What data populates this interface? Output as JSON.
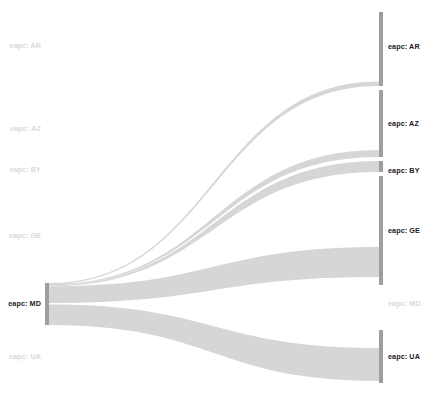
{
  "figure": {
    "type": "sankey",
    "width": 427,
    "height": 401,
    "background": "#ffffff",
    "node_color_active": "#9e9e9e",
    "node_color_inactive": "#e8e8e8",
    "link_color": "#d6d6d6",
    "label_color_active": "#1a1a1a",
    "label_color_inactive": "#d9d9d9"
  },
  "nodes": {
    "left": [
      {
        "id": "L-AR",
        "label": "eapc: AR",
        "x": 45,
        "y0": 32,
        "y1": 32,
        "value": 0,
        "active": false,
        "label_x": 41,
        "label_y": 46
      },
      {
        "id": "L-AZ",
        "label": "eapc: AZ",
        "x": 45,
        "y0": 129,
        "y1": 129,
        "value": 0,
        "active": false,
        "label_x": 41,
        "label_y": 129
      },
      {
        "id": "L-BY",
        "label": "eapc: BY",
        "x": 45,
        "y0": 170,
        "y1": 170,
        "value": 0,
        "active": false,
        "label_x": 41,
        "label_y": 170
      },
      {
        "id": "L-GE",
        "label": "eapc: GE",
        "x": 45,
        "y0": 236,
        "y1": 236,
        "value": 0,
        "active": false,
        "label_x": 41,
        "label_y": 236
      },
      {
        "id": "L-MD",
        "label": "eapc: MD",
        "x": 45,
        "y0": 283,
        "y1": 325,
        "value": 42,
        "active": true,
        "label_x": 41,
        "label_y": 304
      },
      {
        "id": "L-UA",
        "label": "eapc: UA",
        "x": 45,
        "y0": 357,
        "y1": 357,
        "value": 0,
        "active": false,
        "label_x": 41,
        "label_y": 357
      }
    ],
    "right": [
      {
        "id": "R-AR",
        "label": "eapc: AR",
        "x": 379,
        "y0": 12,
        "y1": 86,
        "value": 74,
        "active": true,
        "label_x": 388,
        "label_y": 47
      },
      {
        "id": "R-AZ",
        "label": "eapc: AZ",
        "x": 379,
        "y0": 90,
        "y1": 157,
        "value": 67,
        "active": true,
        "label_x": 388,
        "label_y": 124
      },
      {
        "id": "R-BY",
        "label": "eapc: BY",
        "x": 379,
        "y0": 161,
        "y1": 172,
        "value": 11,
        "active": true,
        "label_x": 388,
        "label_y": 171
      },
      {
        "id": "R-GE",
        "label": "eapc: GE",
        "x": 379,
        "y0": 176,
        "y1": 285,
        "value": 109,
        "active": true,
        "label_x": 388,
        "label_y": 231
      },
      {
        "id": "R-MD",
        "label": "eapc: MD",
        "x": 379,
        "y0": 304,
        "y1": 304,
        "value": 0,
        "active": false,
        "label_x": 388,
        "label_y": 304
      },
      {
        "id": "R-UA",
        "label": "eapc: UA",
        "x": 379,
        "y0": 330,
        "y1": 383,
        "value": 53,
        "active": true,
        "label_x": 388,
        "label_y": 357
      }
    ]
  },
  "links": [
    {
      "source": "eapc: MD",
      "target": "eapc: AR",
      "value": 1.2,
      "sy0": 283.0,
      "sy1": 284.2,
      "ty0": 81.5,
      "ty1": 86.0
    },
    {
      "source": "eapc: MD",
      "target": "eapc: AZ",
      "value": 1.1,
      "sy0": 284.2,
      "sy1": 285.3,
      "ty0": 150.0,
      "ty1": 157.0
    },
    {
      "source": "eapc: MD",
      "target": "eapc: BY",
      "value": 1.0,
      "sy0": 285.3,
      "sy1": 286.3,
      "ty0": 161.0,
      "ty1": 172.0
    },
    {
      "source": "eapc: MD",
      "target": "eapc: GE",
      "value": 18.5,
      "sy0": 286.3,
      "sy1": 303.0,
      "ty0": 247.0,
      "ty1": 277.0
    },
    {
      "source": "eapc: MD",
      "target": "eapc: UA",
      "value": 20.0,
      "sy0": 304.5,
      "sy1": 325.0,
      "ty0": 348.0,
      "ty1": 381.0
    }
  ]
}
